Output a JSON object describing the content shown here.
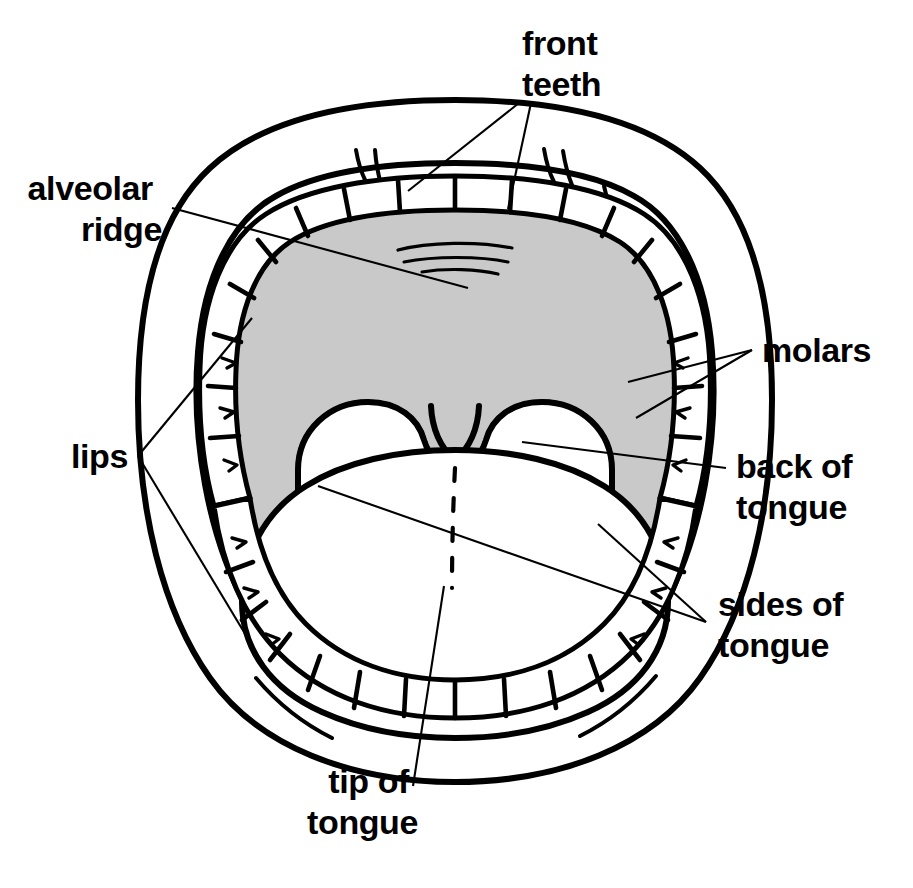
{
  "diagram": {
    "palette": {
      "ink": "#000000",
      "background": "#ffffff",
      "palate_shading": "#c9c9c9",
      "tooth_fill": "#ffffff",
      "tongue_fill": "#ffffff"
    },
    "labels": [
      {
        "id": "front-teeth",
        "lines": [
          "front",
          "teeth"
        ],
        "text": "front teeth",
        "align": "start",
        "x": 522,
        "y": 55,
        "line_height": 41,
        "leaders": 2
      },
      {
        "id": "alveolar-ridge",
        "lines": [
          "alveolar",
          "ridge"
        ],
        "text": "alveolar ridge",
        "align": "end",
        "x": 162,
        "y": 200,
        "line_height": 41,
        "leaders": 1
      },
      {
        "id": "molars",
        "lines": [
          "molars"
        ],
        "text": "molars",
        "align": "start",
        "x": 762,
        "y": 362,
        "line_height": 41,
        "leaders": 2
      },
      {
        "id": "lips",
        "lines": [
          "lips"
        ],
        "text": "lips",
        "align": "end",
        "x": 128,
        "y": 468,
        "line_height": 41,
        "leaders": 2
      },
      {
        "id": "back-of-tongue",
        "lines": [
          "back of",
          "tongue"
        ],
        "text": "back of tongue",
        "align": "start",
        "x": 736,
        "y": 478,
        "line_height": 41,
        "leaders": 1
      },
      {
        "id": "sides-of-tongue",
        "lines": [
          "sides of",
          "tongue"
        ],
        "text": "sides of tongue",
        "align": "start",
        "x": 718,
        "y": 616,
        "line_height": 41,
        "leaders": 2
      },
      {
        "id": "tip-of-tongue",
        "lines": [
          "tip of",
          "tongue"
        ],
        "text": "tip of tongue",
        "align": "end",
        "x": 418,
        "y": 793,
        "line_height": 41,
        "leaders": 1
      }
    ],
    "parts": [
      {
        "id": "upper-lip",
        "name": "upper lip"
      },
      {
        "id": "lower-lip",
        "name": "lower lip"
      },
      {
        "id": "upper-teeth",
        "name": "upper teeth arch"
      },
      {
        "id": "lower-teeth",
        "name": "lower teeth arch"
      },
      {
        "id": "hard-palate",
        "name": "hard palate (shaded)"
      },
      {
        "id": "soft-palate",
        "name": "soft palate and uvula"
      },
      {
        "id": "tongue",
        "name": "tongue"
      },
      {
        "id": "alveolar-rugae",
        "name": "alveolar ridge rugae"
      }
    ]
  }
}
